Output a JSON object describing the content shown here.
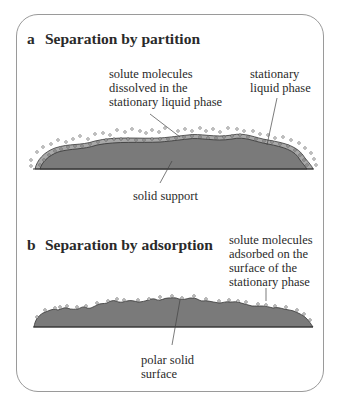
{
  "panel_a": {
    "letter": "a",
    "title": "Separation by partition",
    "label_solute": "solute molecules\ndissolved in the\nstationary liquid phase",
    "label_stationary": "stationary\nliquid phase",
    "label_support": "solid support"
  },
  "panel_b": {
    "letter": "b",
    "title": "Separation by adsorption",
    "label_solute": "solute molecules\nadsorbed on the\nsurface of the\nstationary phase",
    "label_surface": "polar solid\nsurface"
  },
  "colors": {
    "solid": "#7a7a7a",
    "liquid_layer": "#a8a8a8",
    "outline": "#333333",
    "frame": "#9a9a9a"
  }
}
